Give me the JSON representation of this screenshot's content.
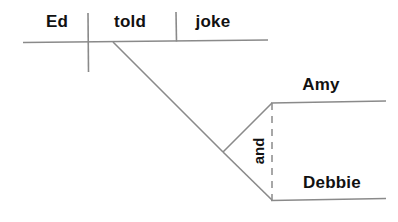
{
  "diagram": {
    "type": "reed-kellogg-sentence-diagram",
    "sentence": "Ed told Amy and Debbie a joke.",
    "ink_color": "#8a8a8a",
    "text_color": "#111111",
    "background_color": "#ffffff",
    "words": {
      "subject": "Ed",
      "verb": "told",
      "direct_object": "joke",
      "indirect_object_1": "Amy",
      "indirect_object_2": "Debbie",
      "conjunction": "and"
    }
  }
}
